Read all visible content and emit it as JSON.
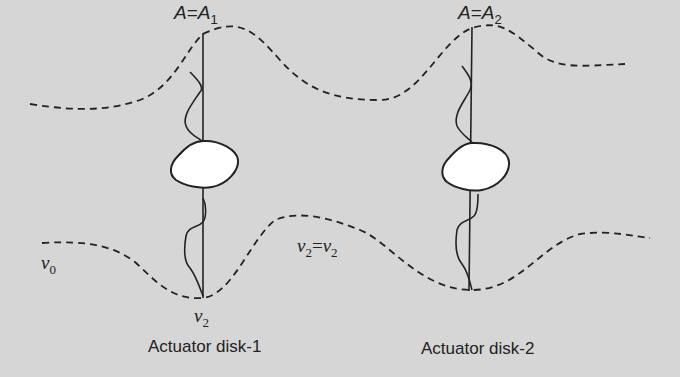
{
  "diagram": {
    "background_color": "#d6d6d6",
    "line_color": "#222222",
    "disk_fill": "#ffffff",
    "disks": [
      {
        "id": "disk-1",
        "area_label": {
          "symbol": "A",
          "equals": "=",
          "rhs_symbol": "A",
          "rhs_subscript": "1"
        },
        "caption": "Actuator disk-1",
        "downstream_velocity": {
          "symbol": "v",
          "subscript": "2"
        }
      },
      {
        "id": "disk-2",
        "area_label": {
          "symbol": "A",
          "equals": "=",
          "rhs_symbol": "A",
          "rhs_subscript": "2"
        },
        "caption": "Actuator disk-2"
      }
    ],
    "velocity_labels": {
      "inlet": {
        "symbol": "v",
        "subscript": "0"
      },
      "between": {
        "lhs_symbol": "v",
        "lhs_subscript": "2",
        "equals": "=",
        "rhs_symbol": "v",
        "rhs_subscript": "2"
      }
    },
    "streamtube": {
      "style": "dashed",
      "upper_boundary": "M 30 104 C 80 112, 110 110, 140 100 C 175 86, 185 50, 205 34 C 240 16, 255 32, 280 60 C 305 88, 330 100, 380 100 C 420 100, 440 40, 470 30 C 500 20, 510 30, 535 50 C 555 70, 580 66, 625 64",
      "lower_boundary": "M 42 243 C 90 240, 115 247, 135 262 C 155 280, 170 300, 200 298 C 230 296, 250 240, 275 220 C 300 210, 330 218, 360 230 C 390 242, 410 290, 470 290 C 520 290, 540 245, 580 234 C 610 230, 630 236, 650 238"
    }
  }
}
